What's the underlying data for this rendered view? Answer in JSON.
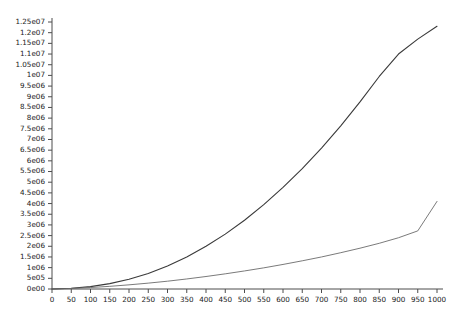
{
  "chart_data": {
    "type": "line",
    "title": "",
    "xlabel": "",
    "ylabel": "",
    "xlim": [
      0,
      1000
    ],
    "ylim": [
      0,
      12500000
    ],
    "grid": false,
    "legend": "none",
    "x_ticks": [
      0,
      50,
      100,
      150,
      200,
      250,
      300,
      350,
      400,
      450,
      500,
      550,
      600,
      650,
      700,
      750,
      800,
      850,
      900,
      950,
      1000
    ],
    "x_tick_labels": [
      "0",
      "50",
      "100",
      "150",
      "200",
      "250",
      "300",
      "350",
      "400",
      "450",
      "500",
      "550",
      "600",
      "650",
      "700",
      "750",
      "800",
      "850",
      "900",
      "950",
      "1000"
    ],
    "y_ticks": [
      0,
      500000,
      1000000,
      1500000,
      2000000,
      2500000,
      3000000,
      3500000,
      4000000,
      4500000,
      5000000,
      5500000,
      6000000,
      6500000,
      7000000,
      7500000,
      8000000,
      8500000,
      9000000,
      9500000,
      10000000,
      10500000,
      11000000,
      11500000,
      12000000,
      12500000
    ],
    "y_tick_labels": [
      "0e00",
      "5e05",
      "1e06",
      "1.5e06",
      "2e06",
      "2.5e06",
      "3e06",
      "3.5e06",
      "4e06",
      "4.5e06",
      "5e06",
      "5.5e06",
      "6e06",
      "6.5e06",
      "7e06",
      "7.5e06",
      "8e06",
      "8.5e06",
      "9e06",
      "9.5e06",
      "1e07",
      "1.05e07",
      "1.1e07",
      "1.15e07",
      "1.2e07",
      "1.25e07"
    ],
    "x": [
      0,
      50,
      100,
      150,
      200,
      250,
      300,
      350,
      400,
      450,
      500,
      550,
      600,
      650,
      700,
      750,
      800,
      850,
      900,
      950,
      1000
    ],
    "series": [
      {
        "name": "upper-curve",
        "color": "#3a3a3a",
        "width": 1.1,
        "values": [
          0,
          33000,
          110000,
          250000,
          455000,
          730000,
          1080000,
          1500000,
          2000000,
          2570000,
          3220000,
          3950000,
          4760000,
          5640000,
          6600000,
          7640000,
          8760000,
          9950000,
          11000000,
          11700000,
          12300000
        ]
      },
      {
        "name": "lower-curve",
        "color": "#6b6b6b",
        "width": 0.9,
        "values": [
          0,
          25000,
          70000,
          125000,
          195000,
          275000,
          365000,
          470000,
          585000,
          710000,
          845000,
          990000,
          1150000,
          1320000,
          1500000,
          1700000,
          1910000,
          2140000,
          2400000,
          2720000,
          4100000
        ]
      }
    ]
  },
  "axes": {
    "origin_x_px": 52,
    "origin_y_px": 289,
    "x_end_px": 437,
    "y_top_px": 22,
    "axis_color": "#4d4d4d"
  }
}
